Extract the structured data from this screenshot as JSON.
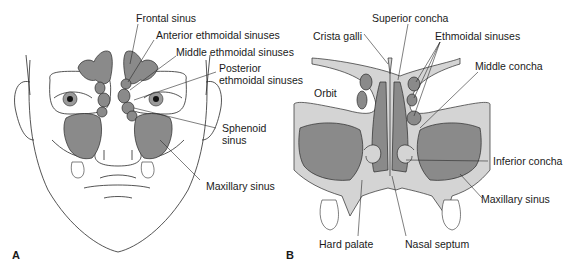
{
  "figure": {
    "panels": [
      {
        "letter": "A",
        "view": "Frontal view of face with paranasal sinuses",
        "labels": {
          "frontal_sinus": "Frontal sinus",
          "anterior_ethmoidal": "Anterior ethmoidal sinuses",
          "middle_ethmoidal": "Middle ethmoidal sinuses",
          "posterior_ethmoidal_1": "Posterior",
          "posterior_ethmoidal_2": "ethmoidal sinuses",
          "sphenoid_1": "Sphenoid",
          "sphenoid_2": "sinus",
          "maxillary": "Maxillary sinus"
        }
      },
      {
        "letter": "B",
        "view": "Coronal section of nasal cavity",
        "labels": {
          "crista_galli": "Crista galli",
          "superior_concha": "Superior concha",
          "ethmoidal_sinuses": "Ethmoidal sinuses",
          "middle_concha": "Middle concha",
          "orbit": "Orbit",
          "inferior_concha": "Inferior concha",
          "maxillary": "Maxillary sinus",
          "hard_palate": "Hard palate",
          "nasal_septum": "Nasal septum"
        }
      }
    ],
    "colors": {
      "sinus_fill": "#8a8a8a",
      "bone_fill": "#d4d4d4",
      "outline": "#2a2a2a",
      "background": "#ffffff"
    }
  }
}
